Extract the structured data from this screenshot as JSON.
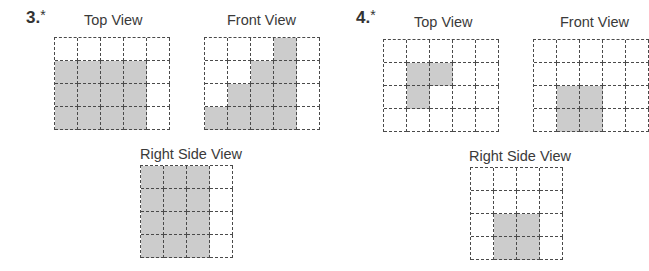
{
  "problems": [
    {
      "label": "3.",
      "marker": "*",
      "views": {
        "top": {
          "title": "Top View",
          "cols": 5,
          "rows": 4,
          "filled": [
            [
              0,
              0,
              0,
              0,
              0
            ],
            [
              1,
              1,
              1,
              1,
              0
            ],
            [
              1,
              1,
              1,
              1,
              0
            ],
            [
              1,
              1,
              1,
              1,
              0
            ]
          ]
        },
        "front": {
          "title": "Front View",
          "cols": 5,
          "rows": 4,
          "filled": [
            [
              0,
              0,
              0,
              1,
              0
            ],
            [
              0,
              0,
              1,
              1,
              0
            ],
            [
              0,
              1,
              1,
              1,
              0
            ],
            [
              1,
              1,
              1,
              1,
              0
            ]
          ]
        },
        "right": {
          "title": "Right Side View",
          "cols": 4,
          "rows": 4,
          "filled": [
            [
              1,
              1,
              1,
              0
            ],
            [
              1,
              1,
              1,
              0
            ],
            [
              1,
              1,
              1,
              0
            ],
            [
              1,
              1,
              1,
              0
            ]
          ]
        }
      }
    },
    {
      "label": "4.",
      "marker": "*",
      "views": {
        "top": {
          "title": "Top View",
          "cols": 5,
          "rows": 4,
          "filled": [
            [
              0,
              0,
              0,
              0,
              0
            ],
            [
              0,
              1,
              1,
              0,
              0
            ],
            [
              0,
              1,
              0,
              0,
              0
            ],
            [
              0,
              0,
              0,
              0,
              0
            ]
          ]
        },
        "front": {
          "title": "Front View",
          "cols": 5,
          "rows": 4,
          "filled": [
            [
              0,
              0,
              0,
              0,
              0
            ],
            [
              0,
              0,
              0,
              0,
              0
            ],
            [
              0,
              1,
              1,
              0,
              0
            ],
            [
              0,
              1,
              1,
              0,
              0
            ]
          ]
        },
        "right": {
          "title": "Right Side View",
          "cols": 4,
          "rows": 4,
          "filled": [
            [
              0,
              0,
              0,
              0
            ],
            [
              0,
              0,
              0,
              0
            ],
            [
              0,
              1,
              1,
              0
            ],
            [
              0,
              1,
              1,
              0
            ]
          ]
        }
      }
    }
  ],
  "colors": {
    "fill": "#cccccc",
    "grid_line": "#4a4a4a",
    "text": "#333333"
  }
}
